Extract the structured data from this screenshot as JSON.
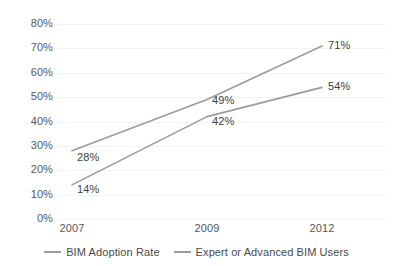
{
  "chart_data": {
    "type": "line",
    "title": "",
    "subtitle": "",
    "xlabel": "",
    "ylabel": "",
    "categories": [
      "2007",
      "2009",
      "2012"
    ],
    "series": [
      {
        "name": "BIM Adoption Rate",
        "values": [
          28,
          49,
          71
        ],
        "labels": [
          "28%",
          "49%",
          "71%"
        ],
        "color": "#9b9b9b"
      },
      {
        "name": "Expert or Advanced BIM Users",
        "values": [
          14,
          42,
          54
        ],
        "labels": [
          "14%",
          "42%",
          "54%"
        ],
        "color": "#9b9b9b"
      }
    ],
    "ylim": [
      0,
      80
    ],
    "ytick_values": [
      80,
      70,
      60,
      50,
      40,
      30,
      20,
      10,
      0
    ],
    "ytick_labels": [
      "80%",
      "70%",
      "60%",
      "50%",
      "40%",
      "30%",
      "20%",
      "10%",
      "0%"
    ],
    "grid": true,
    "grid_color": "#f2f2f2",
    "legend_position": "bottom",
    "legend": [
      "BIM Adoption Rate",
      "Expert or Advanced BIM Users"
    ],
    "annotations": [
      "28%",
      "14%",
      "49%",
      "42%",
      "71%",
      "54%"
    ],
    "background_color": "#ffffff",
    "text_color": "#4a4a4a"
  }
}
